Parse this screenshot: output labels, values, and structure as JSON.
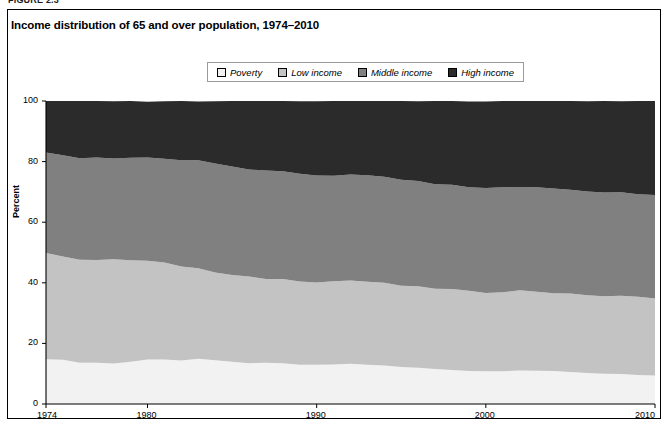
{
  "figure": {
    "number_label": "FIGURE 2.3",
    "title": "Income distribution of 65 and over population, 1974–2010"
  },
  "legend": {
    "items": [
      {
        "label": "Poverty",
        "color": "#f2f2f2"
      },
      {
        "label": "Low income",
        "color": "#c3c3c3"
      },
      {
        "label": "Middle income",
        "color": "#808080"
      },
      {
        "label": "High income",
        "color": "#2b2b2b"
      }
    ]
  },
  "axes": {
    "ylabel": "Percent",
    "yticks": [
      0,
      20,
      40,
      60,
      80,
      100
    ],
    "xticks": [
      1974,
      1980,
      1990,
      2000,
      2010
    ],
    "ylim": [
      0,
      100
    ],
    "xlim": [
      1974,
      2010
    ]
  },
  "chart_data": {
    "type": "area",
    "title": "Income distribution of 65 and over population, 1974–2010",
    "xlabel": "",
    "ylabel": "Percent",
    "ylim": [
      0,
      100
    ],
    "xlim": [
      1974,
      2010
    ],
    "grid": false,
    "stacked": true,
    "legend_position": "top-center",
    "x": [
      1974,
      1975,
      1976,
      1977,
      1978,
      1979,
      1980,
      1981,
      1982,
      1983,
      1984,
      1985,
      1986,
      1987,
      1988,
      1989,
      1990,
      1991,
      1992,
      1993,
      1994,
      1995,
      1996,
      1997,
      1998,
      1999,
      2000,
      2001,
      2002,
      2003,
      2004,
      2005,
      2006,
      2007,
      2008,
      2009,
      2010
    ],
    "series": [
      {
        "name": "Poverty",
        "color": "#f2f2f2",
        "values": [
          15.0,
          14.4,
          13.8,
          13.6,
          13.4,
          14.0,
          14.6,
          14.8,
          14.4,
          14.9,
          14.2,
          13.8,
          13.6,
          13.4,
          13.3,
          13.0,
          12.8,
          13.1,
          13.2,
          13.0,
          12.6,
          12.2,
          11.9,
          11.6,
          11.4,
          11.0,
          10.8,
          11.0,
          11.2,
          11.0,
          10.7,
          10.5,
          10.3,
          10.0,
          10.0,
          9.5,
          9.2
        ]
      },
      {
        "name": "Low income",
        "color": "#c3c3c3",
        "values": [
          35.0,
          34.5,
          33.8,
          34.0,
          34.2,
          33.6,
          32.8,
          31.9,
          30.8,
          30.0,
          29.2,
          28.7,
          28.3,
          28.0,
          27.9,
          27.6,
          27.5,
          27.4,
          27.6,
          27.4,
          27.2,
          26.9,
          26.7,
          26.5,
          26.4,
          26.2,
          26.0,
          26.1,
          26.2,
          26.1,
          26.0,
          25.8,
          25.7,
          25.6,
          25.6,
          25.8,
          25.8
        ]
      },
      {
        "name": "Middle income",
        "color": "#808080",
        "values": [
          32.8,
          33.1,
          33.6,
          33.6,
          33.6,
          33.7,
          33.9,
          34.4,
          35.2,
          35.6,
          35.8,
          35.8,
          35.6,
          35.5,
          35.4,
          35.4,
          35.2,
          35.0,
          34.8,
          35.0,
          35.2,
          35.0,
          34.8,
          34.6,
          34.4,
          34.4,
          34.4,
          34.4,
          34.3,
          34.3,
          34.4,
          34.4,
          34.3,
          34.2,
          34.1,
          34.0,
          33.8
        ]
      },
      {
        "name": "High income",
        "color": "#2b2b2b",
        "values": [
          17.2,
          18.0,
          18.8,
          18.8,
          18.8,
          18.7,
          18.7,
          18.9,
          19.6,
          19.5,
          20.8,
          21.7,
          22.5,
          23.1,
          23.4,
          24.0,
          24.5,
          24.5,
          24.4,
          24.6,
          25.0,
          25.9,
          26.6,
          27.3,
          27.8,
          28.4,
          28.8,
          28.5,
          28.3,
          28.6,
          28.9,
          29.3,
          29.7,
          30.2,
          30.3,
          30.7,
          31.2
        ]
      }
    ]
  }
}
